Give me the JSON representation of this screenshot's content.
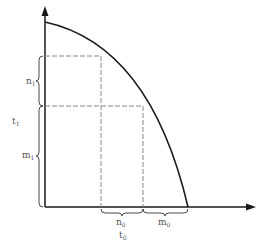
{
  "diagram": {
    "type": "production-possibility-curve",
    "axes": {
      "x_arrow": true,
      "y_arrow": true
    },
    "labels": {
      "n1": {
        "base": "n",
        "sub": "1"
      },
      "t1": {
        "base": "t",
        "sub": "1"
      },
      "m1": {
        "base": "m",
        "sub": "1"
      },
      "n0": {
        "base": "n",
        "sub": "0"
      },
      "m0": {
        "base": "m",
        "sub": "0"
      },
      "t0": {
        "base": "t",
        "sub": "0"
      }
    },
    "colors": {
      "line": "#1a1a1a",
      "dash": "#888888",
      "text": "#555555"
    }
  }
}
